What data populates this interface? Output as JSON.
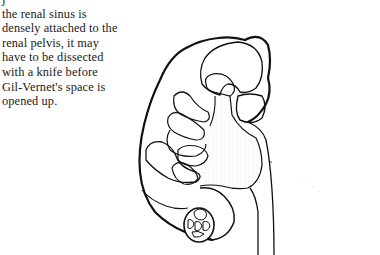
{
  "document": {
    "body_text": {
      "lines": [
        "j",
        "the renal sinus is",
        "densely attached to the",
        "renal pelvis, it may",
        "have to be dissected",
        "with a knife before",
        "Gil-Vernet's space is",
        "opened up."
      ]
    },
    "figure": {
      "subject": "kidney-cross-section-illustration",
      "style": "black line drawing with stippled shading",
      "stroke_color": "#111111",
      "stipple_color": "#b8b8b8"
    }
  }
}
